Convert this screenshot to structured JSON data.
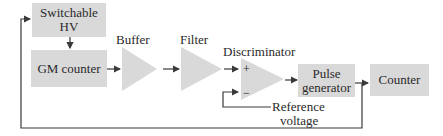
{
  "diagram": {
    "blocks": {
      "hv": "Switchable HV",
      "gm": "GM counter",
      "pulse_line1": "Pulse",
      "pulse_line2": "generator",
      "counter": "Counter"
    },
    "labels": {
      "buffer": "Buffer",
      "filter": "Filter",
      "discriminator": "Discriminator",
      "plus": "+",
      "minus": "−",
      "ref_line1": "Reference",
      "ref_line2": "voltage"
    },
    "colors": {
      "block_fill": "#d9d9d9",
      "line": "#3a3a3a"
    }
  }
}
